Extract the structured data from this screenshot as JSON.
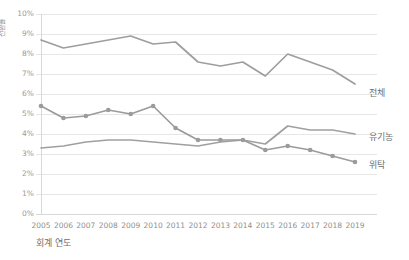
{
  "chart_data": {
    "type": "line",
    "title": "",
    "xlabel": "회계 연도",
    "ylabel": "전환율",
    "categories": [
      "2005",
      "2006",
      "2007",
      "2008",
      "2009",
      "2010",
      "2011",
      "2012",
      "2013",
      "2014",
      "2015",
      "2016",
      "2017",
      "2018",
      "2019"
    ],
    "x": [
      2005,
      2006,
      2007,
      2008,
      2009,
      2010,
      2011,
      2012,
      2013,
      2014,
      2015,
      2016,
      2017,
      2018,
      2019
    ],
    "ylim": [
      0,
      10
    ],
    "ytick_labels": [
      "0%",
      "1%",
      "2%",
      "3%",
      "4%",
      "5%",
      "6%",
      "7%",
      "8%",
      "9%",
      "10%"
    ],
    "ytick_values": [
      0,
      1,
      2,
      3,
      4,
      5,
      6,
      7,
      8,
      9,
      10
    ],
    "grid": true,
    "grid_axis": "y",
    "legend_position": "right-inline",
    "series": [
      {
        "name": "전체",
        "label": "전체",
        "color": "#9e9e9e",
        "markers": false,
        "values": [
          8.7,
          8.3,
          8.5,
          8.7,
          8.9,
          8.5,
          8.6,
          7.6,
          7.4,
          7.6,
          6.9,
          8.0,
          7.6,
          7.2,
          6.5
        ]
      },
      {
        "name": "유기농",
        "label": "유기농",
        "color": "#a0a0a0",
        "markers": false,
        "values": [
          3.3,
          3.4,
          3.6,
          3.7,
          3.7,
          3.6,
          3.5,
          3.4,
          3.6,
          3.7,
          3.5,
          4.4,
          4.2,
          4.2,
          4.0
        ]
      },
      {
        "name": "위탁",
        "label": "위탁",
        "color": "#9b9b9b",
        "markers": true,
        "values": [
          5.4,
          4.8,
          4.9,
          5.2,
          5.0,
          5.4,
          4.3,
          3.7,
          3.7,
          3.7,
          3.2,
          3.4,
          3.2,
          2.9,
          2.6
        ]
      }
    ],
    "axis_color": "#d8d8d8",
    "grid_color": "#e6e6e6",
    "background": "#ffffff"
  },
  "axes": {
    "y_title": "전환율",
    "x_title": "회계 연도"
  }
}
